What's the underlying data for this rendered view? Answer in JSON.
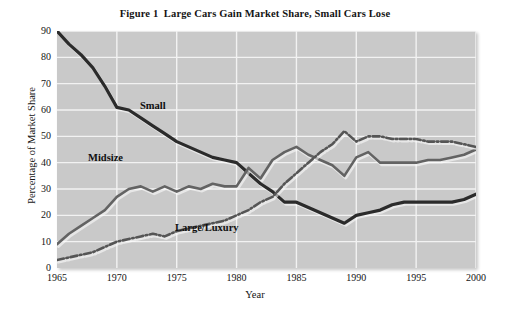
{
  "figure": {
    "title": "Figure 1  Large Cars Gain Market Share, Small Cars Lose"
  },
  "axes": {
    "ylabel": "Percentage of Market Share",
    "xlabel": "Year",
    "yticks": [
      "90",
      "80",
      "70",
      "60",
      "50",
      "40",
      "30",
      "20",
      "10",
      "0"
    ],
    "xticks": [
      "1965",
      "1970",
      "1975",
      "1980",
      "1985",
      "1990",
      "1995",
      "2000"
    ]
  },
  "labels": {
    "small": "Small",
    "midsize": "Midsize",
    "large": "Large/Luxury"
  },
  "colors": {
    "plot_background": "#c9c9c9",
    "gridline": "#f2f2f2",
    "small_line": "#2b2b2b",
    "midsize_line": "#636363",
    "large_line": "#555555",
    "page_background": "#ffffff",
    "text": "#141414"
  },
  "chart_data": {
    "type": "line",
    "title": "Figure 1  Large Cars Gain Market Share, Small Cars Lose",
    "xlabel": "Year",
    "ylabel": "Percentage of Market Share",
    "xlim": [
      1965,
      2000
    ],
    "ylim": [
      0,
      90
    ],
    "ytick_step": 10,
    "xtick_step": 5,
    "grid": true,
    "legend": "inline-annotations",
    "x": [
      1965,
      1966,
      1967,
      1968,
      1969,
      1970,
      1971,
      1972,
      1973,
      1974,
      1975,
      1976,
      1977,
      1978,
      1979,
      1980,
      1981,
      1982,
      1983,
      1984,
      1985,
      1986,
      1987,
      1988,
      1989,
      1990,
      1991,
      1992,
      1993,
      1994,
      1995,
      1996,
      1997,
      1998,
      1999,
      2000
    ],
    "series": [
      {
        "name": "Small",
        "style": "solid",
        "color": "#2b2b2b",
        "values": [
          90,
          85,
          81,
          76,
          69,
          61,
          60,
          57,
          54,
          51,
          48,
          46,
          44,
          42,
          41,
          40,
          36,
          32,
          29,
          25,
          25,
          23,
          21,
          19,
          17,
          20,
          21,
          22,
          24,
          25,
          25,
          25,
          25,
          25,
          26,
          28
        ]
      },
      {
        "name": "Midsize",
        "style": "solid",
        "color": "#636363",
        "values": [
          9,
          13,
          16,
          19,
          22,
          27,
          30,
          31,
          29,
          31,
          29,
          31,
          30,
          32,
          31,
          31,
          38,
          34,
          41,
          44,
          46,
          43,
          41,
          39,
          35,
          42,
          44,
          40,
          40,
          40,
          40,
          41,
          41,
          42,
          43,
          45
        ]
      },
      {
        "name": "Large/Luxury",
        "style": "dash-dot",
        "color": "#555555",
        "values": [
          3,
          4,
          5,
          6,
          8,
          10,
          11,
          12,
          13,
          12,
          14,
          15,
          16,
          17,
          18,
          20,
          22,
          25,
          27,
          32,
          36,
          40,
          44,
          47,
          52,
          48,
          50,
          50,
          49,
          49,
          49,
          48,
          48,
          48,
          47,
          46
        ]
      }
    ]
  }
}
